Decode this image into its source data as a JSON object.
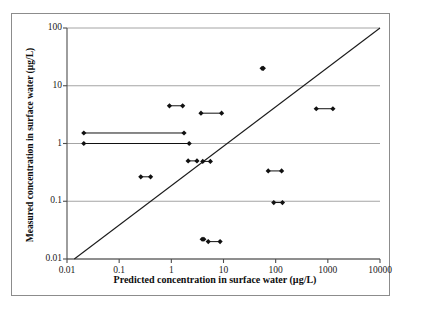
{
  "chart_data": {
    "type": "scatter",
    "title": "",
    "xlabel": "Predicted concentration in surface water (µg/L)",
    "ylabel": "Measured concentration in surface water (µg/L)",
    "xscale": "log",
    "yscale": "log",
    "xlim": [
      0.01,
      10000
    ],
    "ylim": [
      0.01,
      100
    ],
    "xticks": [
      "0.01",
      "0.1",
      "1",
      "10",
      "100",
      "1000",
      "10000"
    ],
    "xtick_values": [
      0.01,
      0.1,
      1,
      10,
      100,
      1000,
      10000
    ],
    "yticks": [
      "100",
      "10",
      "1",
      "0.1",
      "0.01"
    ],
    "ytick_values": [
      100,
      10,
      1,
      0.1,
      0.01
    ],
    "grid": "horizontal",
    "legend": "none",
    "reference_line": {
      "name": "one-to-one-line",
      "description": "1:1 diagonal line",
      "from": [
        0.0138,
        0.01
      ],
      "to": [
        10000,
        100
      ]
    },
    "series": [
      {
        "name": "predicted-vs-measured ranges",
        "marker": "filled-diamond",
        "connector": "horizontal-range-bar",
        "points": [
          {
            "x_low": 0.021,
            "x_high": 1.75,
            "y": 1.52
          },
          {
            "x_low": 0.021,
            "x_high": 2.2,
            "y": 1.0
          },
          {
            "x_low": 0.26,
            "x_high": 0.4,
            "y": 0.265
          },
          {
            "x_low": 0.92,
            "x_high": 1.65,
            "y": 4.5
          },
          {
            "x_low": 2.1,
            "x_high": 3.1,
            "y": 0.5
          },
          {
            "x_low": 3.7,
            "x_high": 9.2,
            "y": 3.35
          },
          {
            "x_low": 4.0,
            "x_high": 5.6,
            "y": 0.49
          },
          {
            "x_low": 3.9,
            "x_high": 4.2,
            "y": 0.022
          },
          {
            "x_low": 5.1,
            "x_high": 8.6,
            "y": 0.02
          },
          {
            "x_low": 55,
            "x_high": 58,
            "y": 20.0
          },
          {
            "x_low": 72,
            "x_high": 130,
            "y": 0.335
          },
          {
            "x_low": 92,
            "x_high": 135,
            "y": 0.095
          },
          {
            "x_low": 600,
            "x_high": 1250,
            "y": 4.0
          }
        ]
      }
    ]
  },
  "style": {
    "axis_color": "#4d4d4d",
    "grid_color": "#9a9a9a",
    "marker_color": "#111111",
    "line_color": "#1a1a1a",
    "frame_color": "#8c8c8c",
    "background": "#ffffff"
  }
}
